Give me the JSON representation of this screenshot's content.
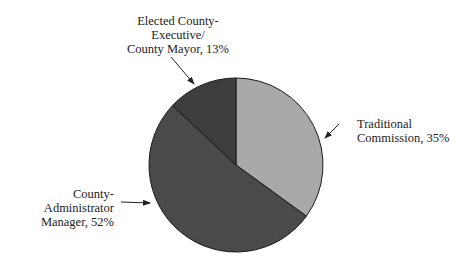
{
  "chart_data": {
    "type": "pie",
    "title": "",
    "start_angle": "12 o'clock",
    "direction": "clockwise",
    "slices": [
      {
        "label": "Traditional Commission",
        "value": 35,
        "color": "#a9a9a9"
      },
      {
        "label": "County-Administrator Manager",
        "value": 52,
        "color": "#4a4a4a"
      },
      {
        "label": "Elected County-Executive/County Mayor",
        "value": 13,
        "color": "#3e3e3e"
      }
    ]
  },
  "labels": {
    "elected": {
      "line1": "Elected County-",
      "line2": "Executive/",
      "line3": "County Mayor, 13%"
    },
    "traditional": {
      "line1": "Traditional",
      "line2": "Commission, 35%"
    },
    "administrator": {
      "line1": "County-",
      "line2": "Administrator",
      "line3": "Manager, 52%"
    }
  }
}
